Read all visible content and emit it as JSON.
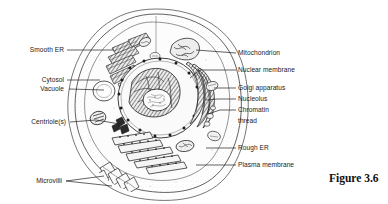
{
  "figure": {
    "caption": "Figure 3.6",
    "style": "black-and-white line drawing with stipple shading"
  },
  "labels_left": [
    {
      "id": "smooth-er",
      "text": "Smooth ER",
      "x": 64,
      "y": 47,
      "leader": {
        "x1": 67,
        "y1": 50,
        "x2": 112,
        "y2": 50
      }
    },
    {
      "id": "cytosol",
      "text": "Cytosol",
      "x": 64,
      "y": 77,
      "leader": {
        "x1": 67,
        "y1": 80,
        "x2": 100,
        "y2": 80
      }
    },
    {
      "id": "vacuole",
      "text": "Vacuole",
      "x": 64,
      "y": 86,
      "leader": {
        "x1": 67,
        "y1": 89,
        "x2": 104,
        "y2": 89
      }
    },
    {
      "id": "centrioles",
      "text": "Centriole(s)",
      "x": 66,
      "y": 119,
      "leader": {
        "x1": 69,
        "y1": 122,
        "x2": 96,
        "y2": 122
      }
    },
    {
      "id": "microvilli",
      "text": "Microvilli",
      "x": 62,
      "y": 178,
      "leader": {
        "x1": 65,
        "y1": 181,
        "x2": 98,
        "y2": 181
      }
    }
  ],
  "labels_right": [
    {
      "id": "mitochondrion",
      "text": "Mitochondrion",
      "x": 238,
      "y": 50,
      "leader": {
        "x1": 229,
        "y1": 53,
        "x2": 236,
        "y2": 53
      }
    },
    {
      "id": "nuclear-membrane",
      "text": "Nuclear membrane",
      "x": 238,
      "y": 67,
      "leader": {
        "x1": 229,
        "y1": 70,
        "x2": 236,
        "y2": 70
      }
    },
    {
      "id": "golgi-apparatus",
      "text": "Golgi apparatus",
      "x": 238,
      "y": 85,
      "leader": {
        "x1": 229,
        "y1": 88,
        "x2": 236,
        "y2": 88
      }
    },
    {
      "id": "nucleolus",
      "text": "Nucleolus",
      "x": 238,
      "y": 96,
      "leader": {
        "x1": 229,
        "y1": 99,
        "x2": 236,
        "y2": 99
      }
    },
    {
      "id": "chromatin",
      "text": "Chromatin",
      "x": 238,
      "y": 107,
      "leader": {
        "x1": 229,
        "y1": 110,
        "x2": 236,
        "y2": 110
      }
    },
    {
      "id": "thread",
      "text": "thread",
      "x": 238,
      "y": 118,
      "leader": null
    },
    {
      "id": "rough-er",
      "text": "Rough ER",
      "x": 238,
      "y": 145,
      "leader": {
        "x1": 229,
        "y1": 148,
        "x2": 236,
        "y2": 148
      }
    },
    {
      "id": "plasma-membrane",
      "text": "Plasma membrane",
      "x": 238,
      "y": 162,
      "leader": {
        "x1": 229,
        "y1": 165,
        "x2": 236,
        "y2": 165
      }
    }
  ],
  "colors": {
    "ink": "#1a1a1a",
    "line": "#3a3a3a",
    "fill_cytoplasm": "#fbfbfb",
    "fill_nucleus": "#f2f2f2",
    "background": "#ffffff"
  }
}
